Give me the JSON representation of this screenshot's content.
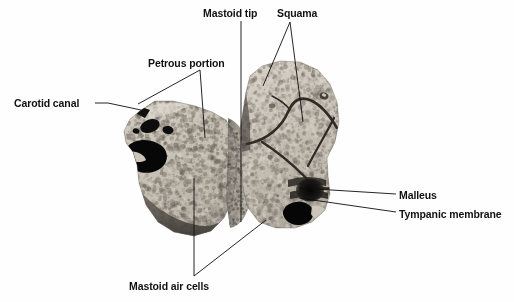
{
  "figure": {
    "kind": "anatomical-specimen-photograph",
    "background_color": "#fefefe",
    "label_color": "#111111",
    "leader_line_color": "#0d0d0d",
    "width": 514,
    "height": 302
  },
  "labels": [
    {
      "id": "carotid-canal",
      "text": "Carotid canal",
      "x": 14,
      "y": 97,
      "leader_style": "dash-then-line",
      "leaders": [
        [
          [
            95,
            103
          ],
          [
            108,
            103
          ]
        ],
        [
          [
            108,
            103
          ],
          [
            141,
            110
          ]
        ]
      ]
    },
    {
      "id": "petrous-portion",
      "text": "Petrous portion",
      "x": 148,
      "y": 57,
      "leader_style": "fork-two",
      "leaders": [
        [
          [
            200,
            70
          ],
          [
            138,
            104
          ]
        ],
        [
          [
            200,
            70
          ],
          [
            205,
            138
          ]
        ]
      ]
    },
    {
      "id": "mastoid-tip",
      "text": "Mastoid tip",
      "x": 203,
      "y": 7,
      "leader_style": "single",
      "leaders": [
        [
          [
            241,
            21
          ],
          [
            241,
            222
          ]
        ]
      ]
    },
    {
      "id": "squama",
      "text": "Squama",
      "x": 277,
      "y": 7,
      "leader_style": "fork-two",
      "leaders": [
        [
          [
            290,
            22
          ],
          [
            263,
            86
          ]
        ],
        [
          [
            290,
            22
          ],
          [
            303,
            122
          ]
        ]
      ]
    },
    {
      "id": "malleus",
      "text": "Malleus",
      "x": 399,
      "y": 189,
      "leader_style": "single",
      "leaders": [
        [
          [
            396,
            194
          ],
          [
            299,
            188
          ]
        ]
      ]
    },
    {
      "id": "tympanic-membrane",
      "text": "Tympanic membrane",
      "x": 399,
      "y": 208,
      "leader_style": "single",
      "leaders": [
        [
          [
            396,
            212
          ],
          [
            299,
            198
          ]
        ]
      ]
    },
    {
      "id": "mastoid-air-cells",
      "text": "Mastoid air cells",
      "x": 129,
      "y": 280,
      "leader_style": "fork-two",
      "leaders": [
        [
          [
            194,
            276
          ],
          [
            194,
            178
          ]
        ],
        [
          [
            194,
            276
          ],
          [
            266,
            220
          ]
        ]
      ]
    }
  ],
  "specimen": {
    "left_lobe": {
      "name": "petrous-mastoid-portion",
      "outline": "M 141,110 L 130,119 L 124,131 L 126,143 L 133,152 L 137,165 L 139,183 L 146,205 L 158,222 L 174,232 L 194,236 L 211,231 L 224,218 L 232,200 L 236,178 L 237,152 L 234,134 L 226,120 L 212,112 L 195,106 L 173,101 L 155,101 Z",
      "bone_tone_light": "#cfc8bc",
      "bone_tone_mid": "#aaa49a",
      "bone_tone_dark": "#6f6a63",
      "features": [
        {
          "name": "carotid-canal-opening",
          "tone": "#0a0a0a"
        },
        {
          "name": "cortical-rim-band",
          "tone": "#5d5952"
        },
        {
          "name": "trabecular-air-cells",
          "tone": "#b8b1a6"
        }
      ]
    },
    "isthmus": {
      "name": "mastoid-tip-bridge",
      "tone": "#8d8880"
    },
    "right_lobe": {
      "name": "squamous-tympanic-portion",
      "outline": "M 246,92 L 250,76 L 262,66 L 280,61 L 300,62 L 318,70 L 330,84 L 337,102 L 339,122 L 335,142 L 327,158 L 328,176 L 330,194 L 325,210 L 312,222 L 295,228 L 276,228 L 259,222 L 248,208 L 243,188 L 241,160 L 240,130 Z",
      "bone_tone_light": "#cfc8bc",
      "bone_tone_mid": "#a8a298",
      "bone_tone_dark": "#6b665f",
      "features": [
        {
          "name": "suture-lines",
          "tone": "#3a3630"
        },
        {
          "name": "malleus-ossicle",
          "tone": "#141414"
        },
        {
          "name": "tympanic-membrane-ring",
          "tone": "#2a2723"
        },
        {
          "name": "external-auditory-canal",
          "tone": "#0c0c0c"
        }
      ]
    }
  }
}
